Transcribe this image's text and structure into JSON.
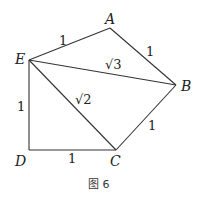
{
  "figure": {
    "caption": "图 6",
    "points": {
      "A": {
        "label": "A",
        "x": 110,
        "y": 28
      },
      "B": {
        "label": "B",
        "x": 176,
        "y": 85
      },
      "C": {
        "label": "C",
        "x": 116,
        "y": 150
      },
      "D": {
        "label": "D",
        "x": 29,
        "y": 150
      },
      "E": {
        "label": "E",
        "x": 29,
        "y": 60
      }
    },
    "segments": [
      {
        "from": "E",
        "to": "A",
        "length_label": "1"
      },
      {
        "from": "A",
        "to": "B",
        "length_label": "1"
      },
      {
        "from": "E",
        "to": "B",
        "length_label": "√3"
      },
      {
        "from": "E",
        "to": "C",
        "length_label": "√2"
      },
      {
        "from": "B",
        "to": "C",
        "length_label": "1"
      },
      {
        "from": "E",
        "to": "D",
        "length_label": "1"
      },
      {
        "from": "D",
        "to": "C",
        "length_label": "1"
      }
    ]
  }
}
